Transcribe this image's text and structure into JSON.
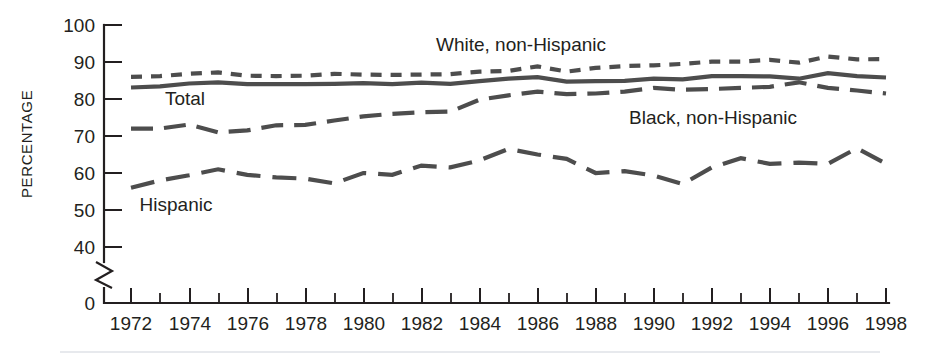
{
  "figure": {
    "background_color": "#ffffff",
    "line_color": "#4d4d4d",
    "axis_color": "#231f20"
  },
  "axes": {
    "y_axis_title": "PERCENTAGE",
    "y_ticks": [
      "0",
      "40",
      "50",
      "60",
      "70",
      "80",
      "90",
      "100"
    ],
    "y_axis_break": true,
    "x_ticks_labeled": [
      "1972",
      "1974",
      "1976",
      "1978",
      "1980",
      "1982",
      "1984",
      "1986",
      "1988",
      "1990",
      "1992",
      "1994",
      "1996",
      "1998"
    ]
  },
  "annotations": {
    "white_label": "White, non-Hispanic",
    "total_label": "Total",
    "black_label": "Black, non-Hispanic",
    "hispanic_label": "Hispanic"
  },
  "chart_data": {
    "type": "line",
    "title": "",
    "xlabel": "",
    "ylabel": "PERCENTAGE",
    "xlim": [
      1972,
      1998
    ],
    "ylim": [
      40,
      100
    ],
    "ylim_displayed_with_break_to": 0,
    "grid": false,
    "legend": "inline-annotations",
    "x": [
      1972,
      1973,
      1974,
      1975,
      1976,
      1977,
      1978,
      1979,
      1980,
      1981,
      1982,
      1983,
      1984,
      1985,
      1986,
      1987,
      1988,
      1989,
      1990,
      1991,
      1992,
      1993,
      1994,
      1995,
      1996,
      1997,
      1998
    ],
    "series": [
      {
        "name": "White, non-Hispanic",
        "style": "short-dash",
        "values": [
          86.0,
          86.2,
          86.8,
          87.2,
          86.3,
          86.2,
          86.3,
          86.8,
          86.6,
          86.5,
          86.6,
          86.7,
          87.4,
          87.6,
          88.8,
          87.4,
          88.4,
          88.9,
          89.1,
          89.5,
          90.1,
          90.1,
          90.6,
          89.8,
          91.5,
          90.7,
          90.8
        ]
      },
      {
        "name": "Total",
        "style": "solid",
        "values": [
          83.1,
          83.4,
          84.2,
          84.5,
          84.0,
          84.0,
          84.0,
          84.1,
          84.3,
          84.0,
          84.4,
          84.1,
          84.8,
          85.5,
          85.9,
          84.7,
          84.8,
          84.9,
          85.5,
          85.3,
          86.2,
          86.2,
          86.1,
          85.5,
          87.0,
          86.2,
          85.8
        ]
      },
      {
        "name": "Black, non-Hispanic",
        "style": "medium-dash",
        "values": [
          72.0,
          72.0,
          73.1,
          71.0,
          71.5,
          72.9,
          73.0,
          74.2,
          75.3,
          76.0,
          76.4,
          76.6,
          79.8,
          81.0,
          82.0,
          81.3,
          81.5,
          82.0,
          83.0,
          82.5,
          82.7,
          83.0,
          83.3,
          84.5,
          83.0,
          82.3,
          81.5
        ]
      },
      {
        "name": "Hispanic",
        "style": "long-dash",
        "values": [
          56.0,
          58.0,
          59.4,
          61.0,
          59.5,
          58.8,
          58.5,
          57.2,
          60.0,
          59.5,
          62.0,
          61.5,
          63.4,
          66.5,
          65.0,
          63.8,
          60.0,
          60.5,
          59.3,
          57.0,
          61.5,
          64.0,
          62.5,
          62.8,
          62.5,
          66.7,
          62.5
        ]
      }
    ]
  }
}
